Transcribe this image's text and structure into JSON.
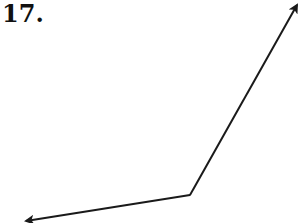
{
  "problem": {
    "number_label": "17."
  },
  "diagram": {
    "stroke_color": "#1a1a1a",
    "vertex": {
      "x": 190,
      "y": 195
    },
    "rays": [
      {
        "name": "upper-ray",
        "to": {
          "x": 298,
          "y": 3
        }
      },
      {
        "name": "lower-ray",
        "to": {
          "x": 24,
          "y": 222
        }
      }
    ]
  }
}
